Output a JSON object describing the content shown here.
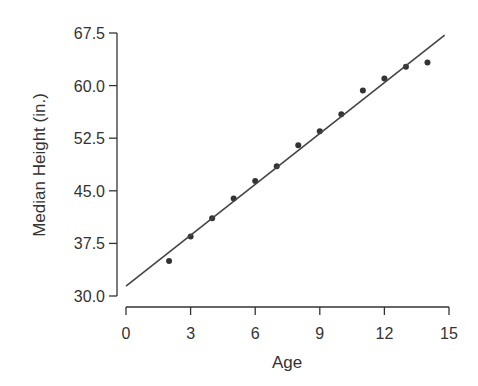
{
  "chart_data": {
    "type": "scatter",
    "title": "",
    "xlabel": "Age",
    "ylabel": "Median Height (in.)",
    "xlim": [
      0,
      15
    ],
    "ylim": [
      30.0,
      67.5
    ],
    "x_ticks": [
      "0",
      "3",
      "6",
      "9",
      "12",
      "15"
    ],
    "y_ticks": [
      "30.0",
      "37.5",
      "45.0",
      "52.5",
      "60.0",
      "67.5"
    ],
    "grid": false,
    "legend": null,
    "series": [
      {
        "name": "Median height",
        "type": "scatter",
        "x": [
          2,
          3,
          4,
          5,
          6,
          7,
          8,
          9,
          10,
          11,
          12,
          13,
          14
        ],
        "y": [
          35.0,
          38.5,
          41.1,
          43.9,
          46.4,
          48.5,
          51.5,
          53.5,
          55.9,
          59.3,
          61.0,
          62.7,
          63.3
        ],
        "color": "#333333"
      },
      {
        "name": "Regression line",
        "type": "line",
        "x": [
          0,
          14.8
        ],
        "y": [
          31.4,
          67.2
        ],
        "color": "#444444"
      }
    ]
  }
}
